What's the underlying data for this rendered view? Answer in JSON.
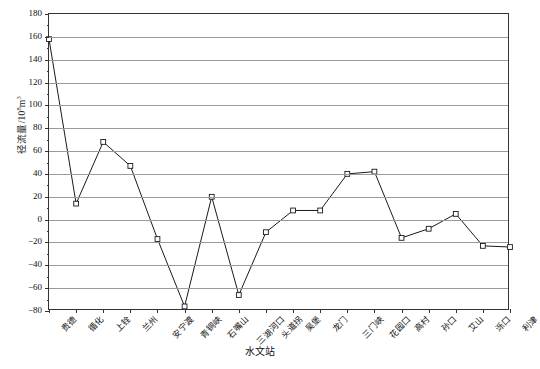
{
  "chart_data": {
    "type": "line",
    "title": "",
    "xlabel": "水文站",
    "ylabel": "径流量/10",
    "ylabel_exponent": "8",
    "ylabel_unit": "m",
    "ylabel_unit_exponent": "3",
    "ylabel_full": "径流量/10⁸m³",
    "categories": [
      "贵德",
      "循化",
      "上铨",
      "兰州",
      "安宁渡",
      "青铜峡",
      "石嘴山",
      "三湖河口",
      "头道拐",
      "吴堡",
      "龙门",
      "三门峡",
      "花园口",
      "高村",
      "孙口",
      "艾山",
      "泺口",
      "利津"
    ],
    "values": [
      158,
      14,
      68,
      47,
      -17,
      -76,
      20,
      -66,
      -11,
      8,
      8,
      40,
      42,
      -16,
      -8,
      5,
      -23,
      -24
    ],
    "ylim": [
      -80,
      180
    ],
    "yticks": [
      180,
      160,
      140,
      120,
      100,
      80,
      60,
      40,
      20,
      0,
      -20,
      -40,
      -60,
      -80
    ],
    "ytick_labels": [
      "180",
      "160",
      "140",
      "120",
      "100",
      "80",
      "60",
      "40",
      "20",
      "0",
      "−20",
      "−40",
      "−60",
      "−80"
    ],
    "grid": true,
    "legend": "none",
    "marker": "open-square",
    "line_color": "#1a1a1a",
    "grid_color": "#9a9a9a",
    "axis_color": "#333333"
  }
}
